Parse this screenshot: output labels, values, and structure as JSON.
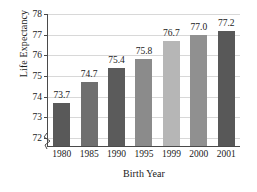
{
  "chart_data": {
    "type": "bar",
    "title": "",
    "xlabel": "Birth Year",
    "ylabel": "Life Expectancy",
    "categories": [
      "1980",
      "1985",
      "1990",
      "1995",
      "1999",
      "2000",
      "2001"
    ],
    "values": [
      73.7,
      74.7,
      75.4,
      75.8,
      76.7,
      77.0,
      77.2
    ],
    "value_labels": [
      "73.7",
      "74.7",
      "75.4",
      "75.8",
      "76.7",
      "77.0",
      "77.2"
    ],
    "bar_colors": [
      "#595959",
      "#6f6f6f",
      "#5b5b5b",
      "#8b8b8b",
      "#b6b6b6",
      "#909090",
      "#585858"
    ],
    "ylim": [
      71.6,
      78
    ],
    "yticks": [
      72,
      73,
      74,
      75,
      76,
      77,
      78
    ],
    "ytick_labels": [
      "72",
      "73",
      "74",
      "75",
      "76",
      "77",
      "78"
    ],
    "grid": true,
    "grid_color": "#d8d8d8",
    "axis_color": "#4a4a4a",
    "axis_break": true,
    "legend": null,
    "legend_position": "none"
  }
}
